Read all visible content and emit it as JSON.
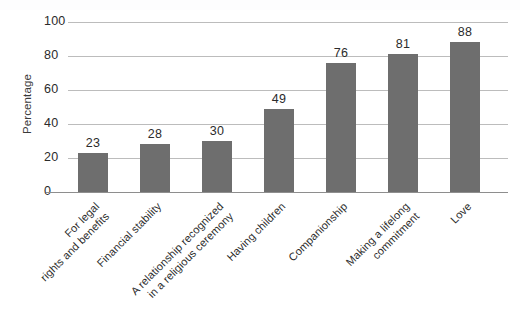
{
  "chart_data": {
    "type": "bar",
    "title": "",
    "xlabel": "",
    "ylabel": "Percentage",
    "ylim": [
      0,
      100
    ],
    "ytick_values": [
      100,
      80,
      60,
      40,
      20,
      0
    ],
    "ytick_labels": [
      "100",
      "80",
      "60",
      "40",
      "20",
      "0"
    ],
    "grid": true,
    "legend": false,
    "bar_color": "#6e6e6e",
    "gridline_color": "#bcbcbc",
    "categories": [
      "For legal\nrights and benefits",
      "Financial stability",
      "A relationship recognized\nin a religious ceremony",
      "Having children",
      "Companionship",
      "Making a lifelong\ncommitment",
      "Love"
    ],
    "values": [
      23,
      28,
      30,
      49,
      76,
      81,
      88
    ],
    "value_labels": [
      "23",
      "28",
      "30",
      "49",
      "76",
      "81",
      "88"
    ]
  }
}
